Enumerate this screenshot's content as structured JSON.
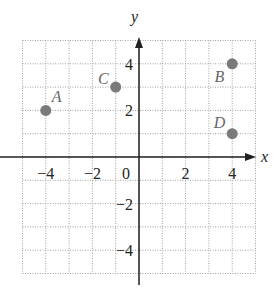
{
  "chart_data": {
    "type": "scatter",
    "title": "",
    "xlabel": "x",
    "ylabel": "y",
    "xlim": [
      -5,
      5
    ],
    "ylim": [
      -5,
      5
    ],
    "grid": true,
    "xticks": [
      -4,
      -2,
      0,
      2,
      4
    ],
    "yticks": [
      4,
      2,
      -2,
      -4
    ],
    "xtick_labels": [
      "−4",
      "−2",
      "0",
      "2",
      "4"
    ],
    "ytick_labels": [
      "4",
      "2",
      "−2",
      "−4"
    ],
    "points": [
      {
        "label": "A",
        "x": -4,
        "y": 2
      },
      {
        "label": "B",
        "x": 4,
        "y": 4
      },
      {
        "label": "C",
        "x": -1,
        "y": 3
      },
      {
        "label": "D",
        "x": 4,
        "y": 1
      }
    ],
    "point_color": "#7a7a7a",
    "grid_color": "#a0a0a0",
    "axis_color": "#222222"
  }
}
